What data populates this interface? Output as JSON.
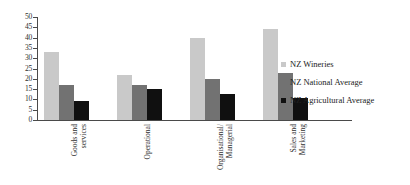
{
  "chart_data": {
    "type": "bar",
    "title": "",
    "xlabel": "",
    "ylabel": "",
    "ylim": [
      0,
      50
    ],
    "ytick_step": 5,
    "grid": false,
    "legend_position": "right",
    "categories": [
      "Goods and\nservices",
      "Operational",
      "Organisational/\nManagerial",
      "Sales and\nMarketing"
    ],
    "yticks": [
      "50",
      "45",
      "40",
      "35",
      "30",
      "25",
      "20",
      "15",
      "10",
      "5",
      "0"
    ],
    "series": [
      {
        "name": "NZ Wineries",
        "color": "#c9c9c9",
        "values": [
          33,
          22,
          40,
          44
        ]
      },
      {
        "name": "NZ National Average",
        "color": "#727272",
        "values": [
          17,
          17,
          20,
          23
        ]
      },
      {
        "name": "NZ Agricultural Average",
        "color": "#101010",
        "values": [
          9,
          15,
          12.5,
          10.5
        ]
      }
    ]
  }
}
